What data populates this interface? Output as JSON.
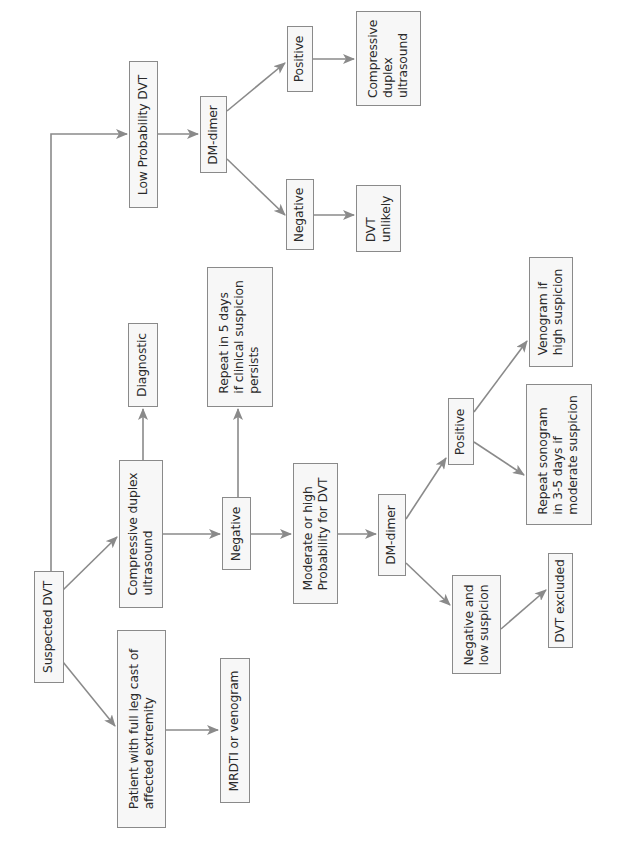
{
  "diagram": {
    "orientation": "rotated-90-ccw",
    "colors": {
      "line": "#8a8a8a",
      "box_border": "#8a8a8a",
      "box_fill": "#f7f7f7",
      "text": "#2a2a2a"
    },
    "nodes": {
      "suspected_dvt": "Suspected DVT",
      "patient_leg_cast": "Patient with full leg cast of\naffected extremity",
      "mrdti_venogram": "MRDTI or venogram",
      "cdu_main": "Compressive duplex\nultrasound",
      "diagnostic": "Diagnostic",
      "negative_cdu": "Negative",
      "repeat_5_days": "Repeat in 5 days\nif clinical suspicion\npersists",
      "moderate_high_prob": "Moderate or high\nProbability for DVT",
      "dmdimer_mod": "DM-dimer",
      "positive_mod": "Positive",
      "negative_low_susp": "Negative and\nlow suspicion",
      "dvt_excluded": "DVT excluded",
      "repeat_sonogram": "Repeat sonogram\nin 3-5 days if\nmoderate suspicion",
      "venogram_high": "Venogram if\nhigh suspicion",
      "low_prob": "Low Probability DVT",
      "dmdimer_low": "DM-dimer",
      "positive_low": "Positive",
      "negative_low": "Negative",
      "cdu_low": "Compressive\nduplex\nultrasound",
      "dvt_unlikely": "DVT\nunlikely"
    },
    "edges": [
      [
        "suspected_dvt",
        "low_prob"
      ],
      [
        "suspected_dvt",
        "cdu_main"
      ],
      [
        "suspected_dvt",
        "patient_leg_cast"
      ],
      [
        "patient_leg_cast",
        "mrdti_venogram"
      ],
      [
        "cdu_main",
        "diagnostic"
      ],
      [
        "cdu_main",
        "negative_cdu"
      ],
      [
        "negative_cdu",
        "repeat_5_days"
      ],
      [
        "negative_cdu",
        "moderate_high_prob"
      ],
      [
        "moderate_high_prob",
        "dmdimer_mod"
      ],
      [
        "dmdimer_mod",
        "positive_mod"
      ],
      [
        "dmdimer_mod",
        "negative_low_susp"
      ],
      [
        "negative_low_susp",
        "dvt_excluded"
      ],
      [
        "positive_mod",
        "repeat_sonogram"
      ],
      [
        "positive_mod",
        "venogram_high"
      ],
      [
        "low_prob",
        "dmdimer_low"
      ],
      [
        "dmdimer_low",
        "positive_low"
      ],
      [
        "dmdimer_low",
        "negative_low"
      ],
      [
        "positive_low",
        "cdu_low"
      ],
      [
        "negative_low",
        "dvt_unlikely"
      ]
    ]
  }
}
